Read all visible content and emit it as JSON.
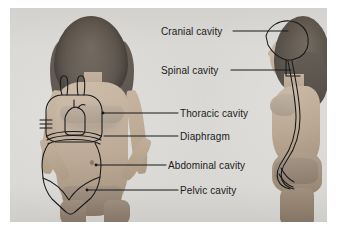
{
  "figure": {
    "background_color": "#d9d8d5",
    "ink_color": "#1b1b1b",
    "views": [
      {
        "name": "anterior-view",
        "description": "Front-facing female figure with body cavity outlines"
      },
      {
        "name": "lateral-view",
        "description": "Side profile female figure with cranial and spinal cavity outlines"
      }
    ]
  },
  "labels": [
    {
      "id": "cranial",
      "text": "Cranial cavity",
      "points_to": "lateral-view-skull"
    },
    {
      "id": "spinal",
      "text": "Spinal cavity",
      "points_to": "lateral-view-vertebral-canal"
    },
    {
      "id": "thoracic",
      "text": "Thoracic cavity",
      "points_to": "anterior-view-chest"
    },
    {
      "id": "diaphragm",
      "text": "Diaphragm",
      "points_to": "anterior-view-diaphragm"
    },
    {
      "id": "abdominal",
      "text": "Abdominal cavity",
      "points_to": "anterior-view-abdomen"
    },
    {
      "id": "pelvic",
      "text": "Pelvic cavity",
      "points_to": "anterior-view-pelvis"
    }
  ]
}
